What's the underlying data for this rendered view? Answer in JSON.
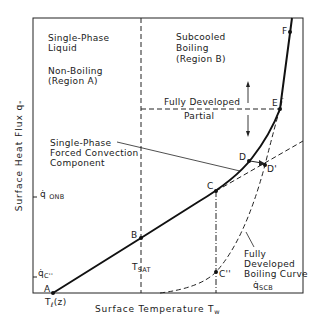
{
  "diagram": {
    "type": "boiling-curve",
    "axes": {
      "x_label": "Surface Temperature T",
      "x_label_sub": "w",
      "y_label": "Surface  Heat  Flux q",
      "y_label_sub": "\"",
      "x_ticks": [
        {
          "main": "T",
          "sub": "ℓ",
          "suffix": "(z)"
        },
        {
          "main": "T",
          "sub": "SAT"
        }
      ],
      "y_ticks": [
        {
          "main": "q̇",
          "sub": "C''"
        },
        {
          "main": "q̇",
          "sub": "ONB"
        }
      ]
    },
    "regions": {
      "a_line1": "Single-Phase",
      "a_line2": "Liquid",
      "a_line3": "Non-Boiling",
      "a_line4": "(Region A)",
      "b_line1": "Subcooled",
      "b_line2": "Boiling",
      "b_line3": "(Region B)"
    },
    "annotations": {
      "fully_developed": "Fully Developed",
      "partial": "Partial",
      "sp_line1": "Single-Phase",
      "sp_line2": "Forced Convection",
      "sp_line3": "Component",
      "fdb_line1": "Fully",
      "fdb_line2": "Developed",
      "fdb_line3": "Boiling Curve",
      "scb_main": "q̇",
      "scb_sub": "SCB"
    },
    "points": {
      "A": "A",
      "B": "B",
      "C": "C",
      "C2": "C''",
      "D": "D",
      "D2": "D'",
      "E": "E",
      "F": "F"
    }
  }
}
